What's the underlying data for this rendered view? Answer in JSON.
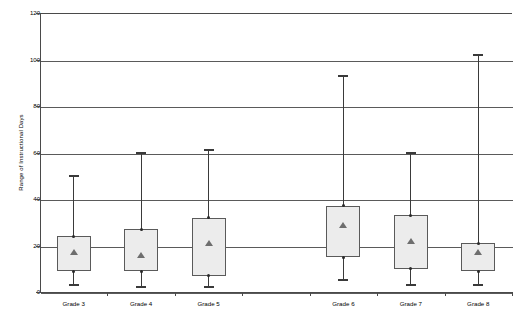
{
  "chart_data": {
    "type": "box",
    "title": "",
    "xlabel": "",
    "ylabel": "Range of Instructional Days",
    "ylim": [
      0,
      120
    ],
    "ytick_labels": [
      "0",
      "20",
      "40",
      "60",
      "80",
      "100",
      "120"
    ],
    "ytick_values": [
      0,
      20,
      40,
      60,
      80,
      100,
      120
    ],
    "grid": true,
    "legend": "none",
    "categories": [
      "Grade 3",
      "Grade 4",
      "Grade 5",
      "",
      "Grade 6",
      "Grade 7",
      "Grade 8"
    ],
    "boxes": [
      {
        "category": "Grade 3",
        "whisker_low": 3,
        "q1": 9,
        "median": 17,
        "q3": 24,
        "whisker_high": 50,
        "mean": 17
      },
      {
        "category": "Grade 4",
        "whisker_low": 2,
        "q1": 9,
        "median": 16,
        "q3": 27,
        "whisker_high": 60,
        "mean": 16
      },
      {
        "category": "Grade 5",
        "whisker_low": 2,
        "q1": 7,
        "median": 21,
        "q3": 32,
        "whisker_high": 61,
        "mean": 21
      },
      {
        "category": "Grade 6",
        "whisker_low": 5,
        "q1": 15,
        "median": 29,
        "q3": 37,
        "whisker_high": 93,
        "mean": 29
      },
      {
        "category": "Grade 7",
        "whisker_low": 3,
        "q1": 10,
        "median": 22,
        "q3": 33,
        "whisker_high": 60,
        "mean": 22
      },
      {
        "category": "Grade 8",
        "whisker_low": 3,
        "q1": 9,
        "median": 17,
        "q3": 21,
        "whisker_high": 102,
        "mean": 17
      }
    ],
    "colors": {
      "box_fill": "#ececec",
      "box_stroke": "#5a5a5a",
      "whisker": "#3a3a3a",
      "gridline": "#5a5a5a",
      "axis": "#4a4a4a",
      "marker": "#6e6e6e",
      "background": "#ffffff"
    }
  }
}
